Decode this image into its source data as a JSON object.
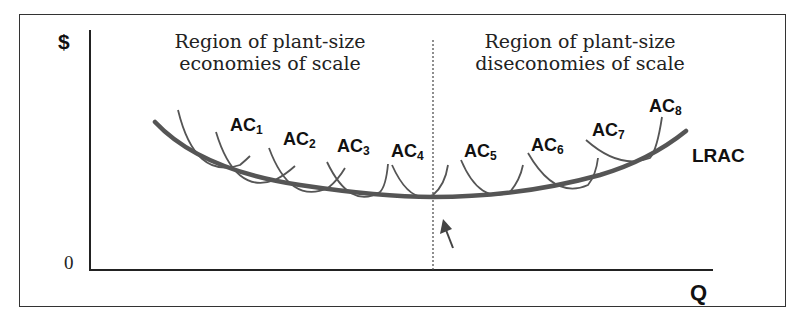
{
  "diagram": {
    "y_axis_label": "$",
    "x_axis_label": "Q",
    "origin_label": "0",
    "left_region": {
      "line1": "Region of plant-size",
      "line2": "economies of scale"
    },
    "right_region": {
      "line1": "Region of plant-size",
      "line2": "diseconomies of scale"
    },
    "lrac_label": "LRAC",
    "short_run_curves": [
      {
        "name": "AC",
        "sub": "1"
      },
      {
        "name": "AC",
        "sub": "2"
      },
      {
        "name": "AC",
        "sub": "3"
      },
      {
        "name": "AC",
        "sub": "4"
      },
      {
        "name": "AC",
        "sub": "5"
      },
      {
        "name": "AC",
        "sub": "6"
      },
      {
        "name": "AC",
        "sub": "7"
      },
      {
        "name": "AC",
        "sub": "8"
      }
    ],
    "colors": {
      "curve": "#555555",
      "axis": "#222222",
      "text": "#111111"
    }
  }
}
